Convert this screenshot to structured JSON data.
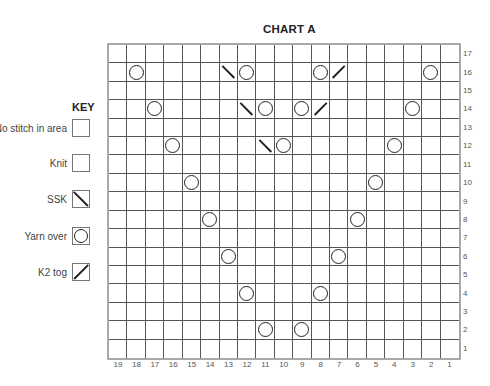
{
  "chart": {
    "title": "CHART A",
    "columns": 19,
    "rows": 17,
    "column_labels": [
      "19",
      "18",
      "17",
      "16",
      "15",
      "14",
      "13",
      "12",
      "11",
      "10",
      "9",
      "8",
      "7",
      "6",
      "5",
      "4",
      "3",
      "2",
      "1"
    ],
    "row_labels": [
      "17",
      "16",
      "15",
      "14",
      "13",
      "12",
      "11",
      "10",
      "9",
      "8",
      "7",
      "6",
      "5",
      "4",
      "3",
      "2",
      "1"
    ],
    "stitches": [
      {
        "row": 16,
        "col": 18,
        "type": "yo"
      },
      {
        "row": 16,
        "col": 13,
        "type": "ssk"
      },
      {
        "row": 16,
        "col": 12,
        "type": "yo"
      },
      {
        "row": 16,
        "col": 8,
        "type": "yo"
      },
      {
        "row": 16,
        "col": 7,
        "type": "k2tog"
      },
      {
        "row": 16,
        "col": 2,
        "type": "yo"
      },
      {
        "row": 14,
        "col": 17,
        "type": "yo"
      },
      {
        "row": 14,
        "col": 12,
        "type": "ssk"
      },
      {
        "row": 14,
        "col": 11,
        "type": "yo"
      },
      {
        "row": 14,
        "col": 9,
        "type": "yo"
      },
      {
        "row": 14,
        "col": 8,
        "type": "k2tog"
      },
      {
        "row": 14,
        "col": 3,
        "type": "yo"
      },
      {
        "row": 12,
        "col": 16,
        "type": "yo"
      },
      {
        "row": 12,
        "col": 11,
        "type": "ssk"
      },
      {
        "row": 12,
        "col": 10,
        "type": "yo"
      },
      {
        "row": 12,
        "col": 4,
        "type": "yo"
      },
      {
        "row": 10,
        "col": 15,
        "type": "yo"
      },
      {
        "row": 10,
        "col": 5,
        "type": "yo"
      },
      {
        "row": 8,
        "col": 14,
        "type": "yo"
      },
      {
        "row": 8,
        "col": 6,
        "type": "yo"
      },
      {
        "row": 6,
        "col": 13,
        "type": "yo"
      },
      {
        "row": 6,
        "col": 7,
        "type": "yo"
      },
      {
        "row": 4,
        "col": 12,
        "type": "yo"
      },
      {
        "row": 4,
        "col": 8,
        "type": "yo"
      },
      {
        "row": 2,
        "col": 11,
        "type": "yo"
      },
      {
        "row": 2,
        "col": 9,
        "type": "yo"
      }
    ]
  },
  "key": {
    "title": "KEY",
    "items": [
      {
        "label": "No stitch in area",
        "symbol": "no-stitch"
      },
      {
        "label": "Knit",
        "symbol": "knit"
      },
      {
        "label": "SSK",
        "symbol": "ssk"
      },
      {
        "label": "Yarn over",
        "symbol": "yo"
      },
      {
        "label": "K2 tog",
        "symbol": "k2tog"
      }
    ]
  },
  "colors": {
    "grid_line": "#555555",
    "grid_border": "#a8a8a8",
    "no_stitch_shade": "#f1f1f1",
    "symbol": "#222222"
  }
}
